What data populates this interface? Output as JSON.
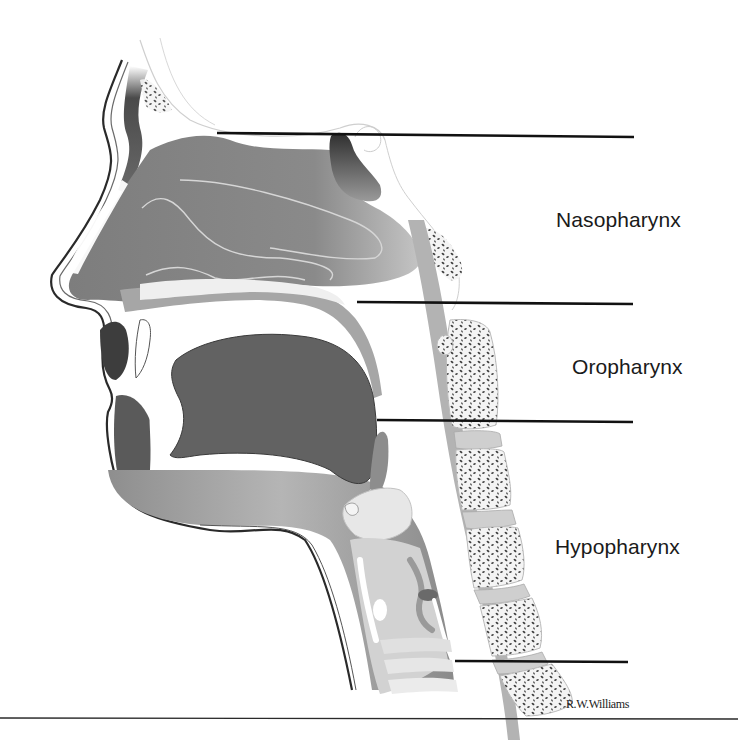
{
  "figure": {
    "labels": [
      {
        "id": "nasopharynx",
        "text": "Nasopharynx"
      },
      {
        "id": "oropharynx",
        "text": "Oropharynx"
      },
      {
        "id": "hypopharynx",
        "text": "Hypopharynx"
      }
    ],
    "credit": "R.W.Williams",
    "colors": {
      "background": "#ffffff",
      "tissue_dark": "#5e5e5e",
      "tissue_mid": "#8c8c8c",
      "tissue_light": "#c9c9c9",
      "bone_speckle": "#3c3c3c",
      "leader_line": "#111111"
    }
  }
}
